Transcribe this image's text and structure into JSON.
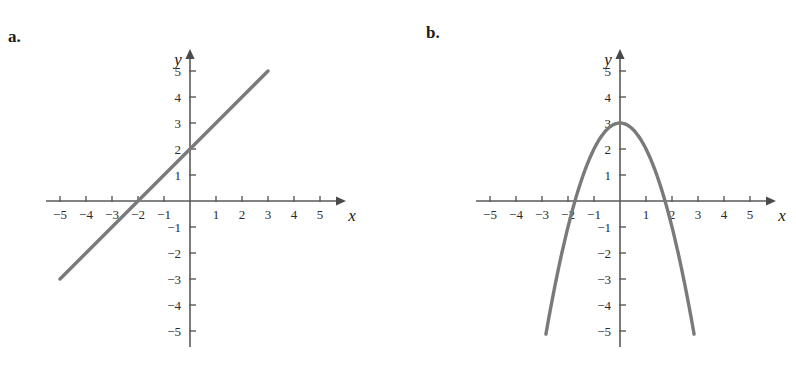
{
  "figure": {
    "background_color": "#ffffff",
    "curve_color": "#7a7a7a",
    "axis_color": "#5a5a5a",
    "text_color": "#1a1a1a"
  },
  "panels": [
    {
      "label": "a.",
      "axis_x_name": "x",
      "axis_y_name": "y",
      "x_tick_labels": [
        "−5",
        "−4",
        "−3",
        "−2",
        "−1",
        "1",
        "2",
        "3",
        "4",
        "5"
      ],
      "y_tick_labels": [
        "5",
        "4",
        "3",
        "2",
        "1",
        "−1",
        "−2",
        "−3",
        "−4",
        "−5"
      ]
    },
    {
      "label": "b.",
      "axis_x_name": "x",
      "axis_y_name": "y",
      "x_tick_labels": [
        "−5",
        "−4",
        "−3",
        "−2",
        "−1",
        "1",
        "2",
        "3",
        "4",
        "5"
      ],
      "y_tick_labels": [
        "5",
        "4",
        "3",
        "2",
        "1",
        "−1",
        "−2",
        "−3",
        "−4",
        "−5"
      ]
    }
  ],
  "chart_data": [
    {
      "type": "line",
      "title": "a.",
      "xlabel": "x",
      "ylabel": "y",
      "xlim": [
        -5.6,
        5.6
      ],
      "ylim": [
        -5.6,
        5.6
      ],
      "xticks": [
        -5,
        -4,
        -3,
        -2,
        -1,
        1,
        2,
        3,
        4,
        5
      ],
      "yticks": [
        5,
        4,
        3,
        2,
        1,
        -1,
        -2,
        -3,
        -4,
        -5
      ],
      "grid": false,
      "legend": "none",
      "equation": "y = x + 2",
      "series": [
        {
          "name": "line",
          "x": [
            -5,
            -4,
            -3,
            -2,
            -1,
            0,
            1,
            2,
            3
          ],
          "values": [
            -3,
            -2,
            -1,
            0,
            1,
            2,
            3,
            4,
            5
          ]
        }
      ],
      "annotations": [
        "y-intercept at (0, 2)",
        "x-intercept at (-2, 0)",
        "slope = 1"
      ]
    },
    {
      "type": "line",
      "title": "b.",
      "xlabel": "x",
      "ylabel": "y",
      "xlim": [
        -5.6,
        5.6
      ],
      "ylim": [
        -5.6,
        5.6
      ],
      "xticks": [
        -5,
        -4,
        -3,
        -2,
        -1,
        1,
        2,
        3,
        4,
        5
      ],
      "yticks": [
        5,
        4,
        3,
        2,
        1,
        -1,
        -2,
        -3,
        -4,
        -5
      ],
      "grid": false,
      "legend": "none",
      "equation": "y = 3 − x²",
      "series": [
        {
          "name": "parabola",
          "x": [
            -2.85,
            -2.5,
            -2,
            -1.75,
            -1.5,
            -1,
            -0.5,
            0,
            0.5,
            1,
            1.5,
            1.75,
            2,
            2.5,
            2.85
          ],
          "values": [
            -5.1,
            -3.25,
            -1,
            0,
            0.75,
            2,
            2.75,
            3,
            2.75,
            2,
            0.75,
            0,
            -1,
            -3.25,
            -5.1
          ]
        }
      ],
      "annotations": [
        "vertex at (0, 3)",
        "x-intercepts near ±1.75",
        "opens downward"
      ]
    }
  ]
}
